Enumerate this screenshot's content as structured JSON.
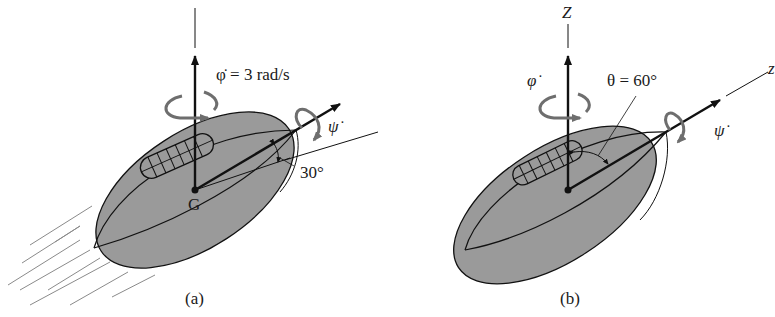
{
  "figure": {
    "colors": {
      "ball_fill": "#9a9a9a",
      "ink": "#111111",
      "spin_arrow": "#6e6e6e",
      "streaks": "#8a8a8a",
      "background": "#ffffff"
    },
    "panel_a": {
      "caption": "(a)",
      "phi_dot_label": "φ̇ = 3 rad/s",
      "psi_dot_label": "ψ̇",
      "angle_label": "30°",
      "center_label": "G"
    },
    "panel_b": {
      "caption": "(b)",
      "Z_axis_label": "Z",
      "z_axis_label": "z",
      "phi_dot_label": "φ̇",
      "psi_dot_label": "ψ̇",
      "theta_label": "θ = 60°"
    }
  }
}
